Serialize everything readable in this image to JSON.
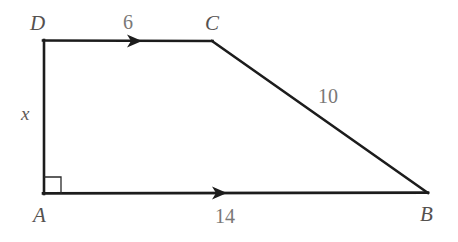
{
  "figure": {
    "kind": "trapezoid",
    "background_color": "#ffffff",
    "stroke_color": "#1c1c1c",
    "stroke_width": 2.6,
    "right_angle_stroke_width": 1.3,
    "vertices": [
      {
        "name": "D",
        "label": "D",
        "x": 44,
        "y": 40,
        "label_x": 30,
        "label_y": 13
      },
      {
        "name": "C",
        "label": "C",
        "x": 212,
        "y": 41,
        "label_x": 205,
        "label_y": 13
      },
      {
        "name": "B",
        "label": "B",
        "x": 427,
        "y": 193,
        "label_x": 420,
        "label_y": 204
      },
      {
        "name": "A",
        "label": "A",
        "x": 44,
        "y": 194,
        "label_x": 33,
        "label_y": 205
      }
    ],
    "sides": [
      {
        "name": "DC",
        "from": "D",
        "to": "C",
        "label": "6",
        "label_x": 123,
        "label_y": 12,
        "parallel_marks": 1
      },
      {
        "name": "CB",
        "from": "C",
        "to": "B",
        "label": "10",
        "label_x": 318,
        "label_y": 86,
        "parallel_marks": 0
      },
      {
        "name": "AB",
        "from": "A",
        "to": "B",
        "label": "14",
        "label_x": 215,
        "label_y": 206,
        "parallel_marks": 1
      },
      {
        "name": "DA",
        "from": "D",
        "to": "A",
        "label": "x",
        "label_x": 21,
        "label_y": 104,
        "parallel_marks": 0
      }
    ],
    "right_angle": {
      "at_vertex": "A",
      "size": 17
    },
    "parallel_arrows": [
      {
        "on_side": "DC",
        "x": 137,
        "y": 41,
        "direction": "right"
      },
      {
        "on_side": "AB",
        "x": 222,
        "y": 193,
        "direction": "right"
      }
    ]
  }
}
